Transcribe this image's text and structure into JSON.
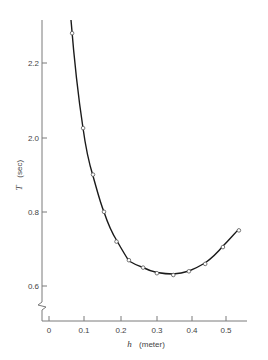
{
  "chart_data": {
    "type": "line",
    "title": "",
    "xlabel": "h (meter)",
    "ylabel": "T (sec)",
    "xlabel_var": "h",
    "xlabel_unit": "(meter)",
    "ylabel_var": "T",
    "ylabel_unit": "(sec)",
    "xlim": [
      0,
      0.58
    ],
    "ylim": [
      1.55,
      2.3
    ],
    "x_ticks": [
      {
        "value": 0,
        "label": "0"
      },
      {
        "value": 0.1,
        "label": "0.1"
      },
      {
        "value": 0.2,
        "label": "0.2"
      },
      {
        "value": 0.3,
        "label": "0.3"
      },
      {
        "value": 0.4,
        "label": "0.4"
      },
      {
        "value": 0.5,
        "label": "0.5"
      }
    ],
    "y_ticks": [
      {
        "value": 2.2,
        "label": "2.2"
      },
      {
        "value": 2.0,
        "label": "2.0"
      },
      {
        "value": 1.8,
        "label": "0.8"
      },
      {
        "value": 1.6,
        "label": "0.6"
      }
    ],
    "y_axis_break": true,
    "grid": false,
    "legend": null,
    "series": [
      {
        "name": "measured period",
        "marker": "open-circle",
        "line": "smooth-fit",
        "points": [
          {
            "x": 0.065,
            "y": 2.28
          },
          {
            "x": 0.096,
            "y": 2.025
          },
          {
            "x": 0.124,
            "y": 1.9
          },
          {
            "x": 0.155,
            "y": 1.8
          },
          {
            "x": 0.19,
            "y": 1.72
          },
          {
            "x": 0.225,
            "y": 1.67
          },
          {
            "x": 0.265,
            "y": 1.65
          },
          {
            "x": 0.304,
            "y": 1.635
          },
          {
            "x": 0.35,
            "y": 1.63
          },
          {
            "x": 0.394,
            "y": 1.64
          },
          {
            "x": 0.44,
            "y": 1.66
          },
          {
            "x": 0.49,
            "y": 1.705
          },
          {
            "x": 0.535,
            "y": 1.75
          }
        ]
      }
    ],
    "colors": {
      "curve": "#1a1a1a",
      "axis": "#777777",
      "marker_fill": "#ffffff",
      "marker_stroke": "#555555"
    }
  }
}
